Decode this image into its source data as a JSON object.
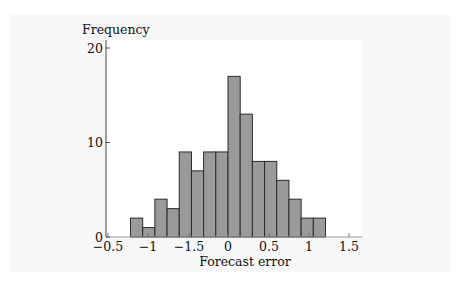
{
  "chart_data": {
    "type": "bar",
    "subtype": "histogram",
    "title": "",
    "xlabel": "Forecast error",
    "ylabel": "Frequency",
    "x_tick_labels": [
      "−0.5",
      "−1",
      "−1.5",
      "0",
      "0.5",
      "1",
      "1.5"
    ],
    "y_tick_labels": [
      "0",
      "10",
      "20"
    ],
    "ylim": [
      0,
      20
    ],
    "grid": false,
    "legend": null,
    "bin_count": 16,
    "values": [
      2,
      1,
      4,
      3,
      9,
      7,
      9,
      9,
      17,
      13,
      8,
      8,
      6,
      4,
      2,
      2
    ],
    "bar_fill": "#9a9a9a",
    "bar_stroke": "#2a2a2a"
  },
  "axis": {
    "xlabel": "Forecast error",
    "ylabel": "Frequency"
  }
}
